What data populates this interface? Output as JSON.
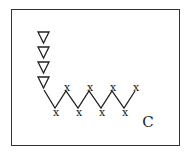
{
  "diagram": {
    "border_color": "#333333",
    "stroke_color": "#222222",
    "triangle_symbol": "▽",
    "triangles": [
      {
        "x": 43.5,
        "y": 31
      },
      {
        "x": 43.5,
        "y": 46
      },
      {
        "x": 43.5,
        "y": 61
      },
      {
        "x": 43.5,
        "y": 76
      }
    ],
    "x_marks": {
      "symbol": "x",
      "bottom": [
        [
          56,
          113
        ],
        [
          79,
          113
        ],
        [
          102,
          113
        ],
        [
          125,
          113
        ]
      ],
      "top": [
        [
          67,
          88
        ],
        [
          90,
          88
        ],
        [
          113,
          88
        ],
        [
          136,
          88
        ]
      ]
    },
    "label": "C"
  }
}
